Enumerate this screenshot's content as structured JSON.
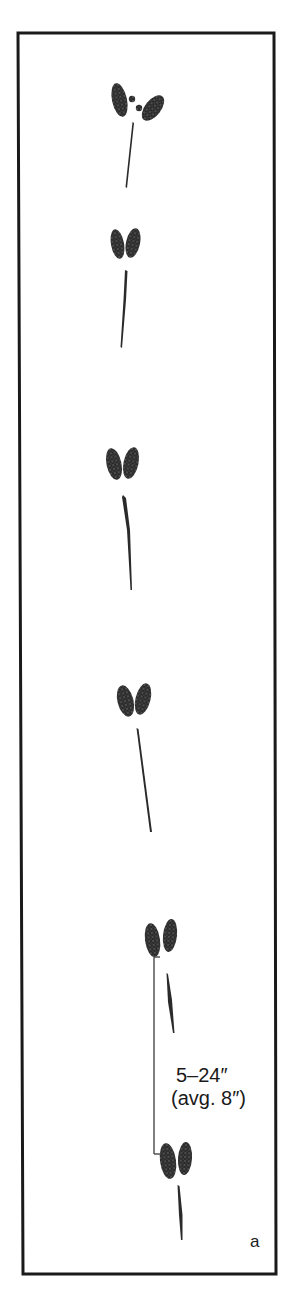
{
  "figure": {
    "panel_label": "a",
    "measurement": {
      "range": "5–24″",
      "average": "(avg. 8″)"
    },
    "colors": {
      "frame": "#1a1a1a",
      "print": "#2a2a2a",
      "background": "#ffffff"
    },
    "track_count": 6,
    "tracks": [
      {
        "id": 1,
        "description": "splayed two-lobed print with dewclaw dots and drag line"
      },
      {
        "id": 2,
        "description": "two-lobed print with drag line"
      },
      {
        "id": 3,
        "description": "two-lobed print with drag line"
      },
      {
        "id": 4,
        "description": "two-lobed print with drag line"
      },
      {
        "id": 5,
        "description": "two-lobed print with drag line, start of stride measurement"
      },
      {
        "id": 6,
        "description": "two-lobed print with drag line, end of stride measurement"
      }
    ]
  }
}
